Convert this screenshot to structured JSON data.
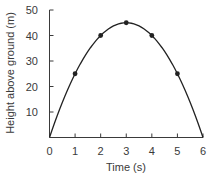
{
  "chart_data": {
    "type": "line",
    "title": "",
    "xlabel": "Time (s)",
    "ylabel": "Height above ground (m)",
    "xlim": [
      0,
      6
    ],
    "ylim": [
      0,
      50
    ],
    "x_ticks": [
      0,
      1,
      2,
      3,
      4,
      5,
      6
    ],
    "y_ticks": [
      10,
      20,
      30,
      40,
      50
    ],
    "grid": false,
    "legend": null,
    "series": [
      {
        "name": "Height",
        "curve": "parabola h = 30t - 5t^2",
        "x": [
          1,
          2,
          3,
          4,
          5
        ],
        "values": [
          25,
          40,
          45,
          40,
          25
        ],
        "markers": true
      }
    ],
    "curve_endpoints": [
      [
        0,
        0
      ],
      [
        6,
        0
      ]
    ],
    "colors": {
      "line": "#222222",
      "axis": "#3a3a3a",
      "text": "#3a3a3a"
    }
  }
}
